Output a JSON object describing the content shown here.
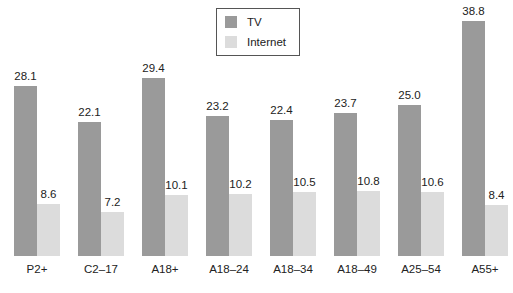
{
  "chart_data": {
    "type": "bar",
    "title": "",
    "xlabel": "",
    "ylabel": "",
    "categories": [
      "P2+",
      "C2–17",
      "A18+",
      "A18–24",
      "A18–34",
      "A18–49",
      "A25–54",
      "A55+"
    ],
    "series": [
      {
        "name": "TV",
        "color": "#9a9a9a",
        "values": [
          28.1,
          22.1,
          29.4,
          23.2,
          22.4,
          23.7,
          25.0,
          38.8
        ]
      },
      {
        "name": "Internet",
        "color": "#dcdcdc",
        "values": [
          8.6,
          7.2,
          10.1,
          10.2,
          10.5,
          10.8,
          10.6,
          8.4
        ]
      }
    ],
    "value_labels": {
      "TV": [
        "28.1",
        "22.1",
        "29.4",
        "23.2",
        "22.4",
        "23.7",
        "25.0",
        "38.8"
      ],
      "Internet": [
        "8.6",
        "7.2",
        "10.1",
        "10.2",
        "10.5",
        "10.8",
        "10.6",
        "8.4"
      ]
    },
    "ylim": [
      0,
      40
    ],
    "grid": false,
    "legend_position": "top-center",
    "data_labels": true
  },
  "legend": {
    "items": [
      {
        "label": "TV",
        "color": "#9a9a9a"
      },
      {
        "label": "Internet",
        "color": "#dcdcdc"
      }
    ]
  }
}
